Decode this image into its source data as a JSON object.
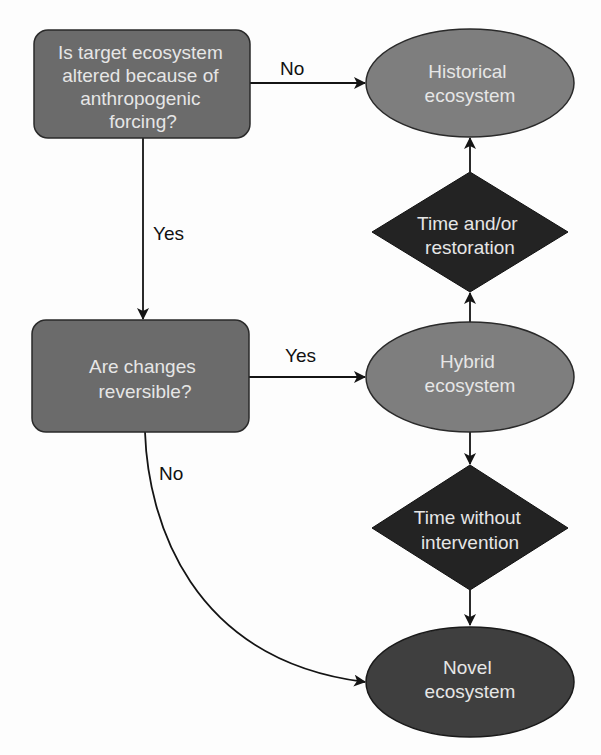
{
  "diagram": {
    "type": "flowchart",
    "colors": {
      "decision_box_fill": "#6b6b6b",
      "historical_fill": "#7e7e7e",
      "hybrid_fill": "#7e7e7e",
      "novel_fill": "#3f3f3f",
      "diamond_fill": "#232323",
      "node_text": "#e6e6e6",
      "edge": "#141414",
      "label_text": "#111111"
    },
    "nodes": {
      "q1": {
        "shape": "rounded-rectangle",
        "lines": [
          "Is target ecosystem",
          "altered because of",
          "anthropogenic",
          "forcing?"
        ]
      },
      "q2": {
        "shape": "rounded-rectangle",
        "lines": [
          "Are changes",
          "reversible?"
        ]
      },
      "historical": {
        "shape": "ellipse",
        "lines": [
          "Historical",
          "ecosystem"
        ]
      },
      "time_restoration": {
        "shape": "diamond",
        "lines": [
          "Time and/or",
          "restoration"
        ]
      },
      "hybrid": {
        "shape": "ellipse",
        "lines": [
          "Hybrid",
          "ecosystem"
        ]
      },
      "time_no_intervention": {
        "shape": "diamond",
        "lines": [
          "Time without",
          "intervention"
        ]
      },
      "novel": {
        "shape": "ellipse",
        "lines": [
          "Novel",
          "ecosystem"
        ]
      }
    },
    "edges": [
      {
        "from": "q1",
        "to": "historical",
        "label": "No"
      },
      {
        "from": "q1",
        "to": "q2",
        "label": "Yes"
      },
      {
        "from": "q2",
        "to": "hybrid",
        "label": "Yes"
      },
      {
        "from": "q2",
        "to": "novel",
        "label": "No"
      },
      {
        "from": "hybrid",
        "to": "time_restoration",
        "label": ""
      },
      {
        "from": "time_restoration",
        "to": "historical",
        "label": ""
      },
      {
        "from": "hybrid",
        "to": "time_no_intervention",
        "label": ""
      },
      {
        "from": "time_no_intervention",
        "to": "novel",
        "label": ""
      }
    ]
  }
}
